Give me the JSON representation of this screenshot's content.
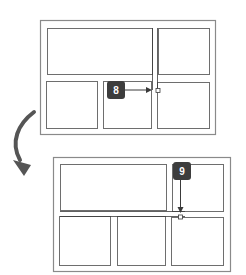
{
  "colors": {
    "frame": "#8a8a8a",
    "panel": "#6e6e6e",
    "guide": "#3a3a3a",
    "badge_bg": "#3d3d3d",
    "badge_text": "#ffffff",
    "arrow": "#4a4a4a",
    "curved_arrow": "#555555"
  },
  "steps": [
    {
      "label": "8",
      "description": "Handle being dragged horizontally toward panel intersection",
      "arrow_direction": "right"
    },
    {
      "label": "9",
      "description": "Handle being dragged vertically down to new position",
      "arrow_direction": "down"
    }
  ],
  "diagrams": [
    {
      "name": "before-layout",
      "panels": 5
    },
    {
      "name": "after-layout",
      "panels": 5
    }
  ],
  "transition_icon": "curved-arrow-down-right-icon"
}
